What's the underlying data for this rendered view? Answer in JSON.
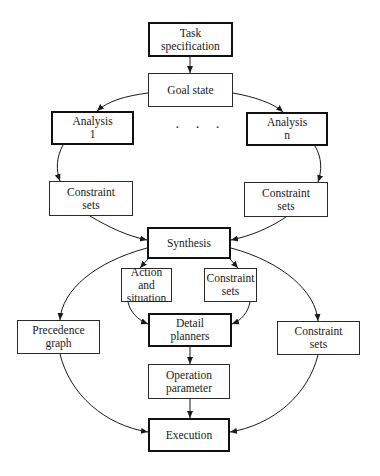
{
  "diagram": {
    "title": "",
    "nodes": {
      "task_spec": "Task\nspecification",
      "goal_state": "Goal state",
      "analysis_1": "Analysis\n1",
      "analysis_n": "Analysis\nn",
      "ellipsis": "· · ·",
      "constraint_sets_left": "Constraint\nsets",
      "constraint_sets_right": "Constraint\nsets",
      "synthesis": "Synthesis",
      "action_situation": "Action and\nsituation",
      "constraint_sets_mid": "Constraint\nsets",
      "detail_planners": "Detail\nplanners",
      "precedence_graph": "Precedence\ngraph",
      "constraint_sets_far_right": "Constraint\nsets",
      "operation_parameter": "Operation\nparameter",
      "execution": "Execution"
    },
    "edges": [
      {
        "from": "task_spec",
        "to": "goal_state"
      },
      {
        "from": "goal_state",
        "to": "analysis_1"
      },
      {
        "from": "goal_state",
        "to": "analysis_n"
      },
      {
        "from": "analysis_1",
        "to": "constraint_sets_left"
      },
      {
        "from": "analysis_n",
        "to": "constraint_sets_right"
      },
      {
        "from": "constraint_sets_left",
        "to": "synthesis"
      },
      {
        "from": "constraint_sets_right",
        "to": "synthesis"
      },
      {
        "from": "synthesis",
        "to": "action_situation"
      },
      {
        "from": "synthesis",
        "to": "constraint_sets_mid"
      },
      {
        "from": "synthesis",
        "to": "precedence_graph"
      },
      {
        "from": "synthesis",
        "to": "constraint_sets_far_right"
      },
      {
        "from": "action_situation",
        "to": "detail_planners"
      },
      {
        "from": "constraint_sets_mid",
        "to": "detail_planners"
      },
      {
        "from": "detail_planners",
        "to": "operation_parameter"
      },
      {
        "from": "operation_parameter",
        "to": "execution"
      },
      {
        "from": "precedence_graph",
        "to": "execution"
      },
      {
        "from": "constraint_sets_far_right",
        "to": "execution"
      }
    ],
    "colors": {
      "line": "#1a1a1a",
      "background": "#ffffff"
    }
  }
}
